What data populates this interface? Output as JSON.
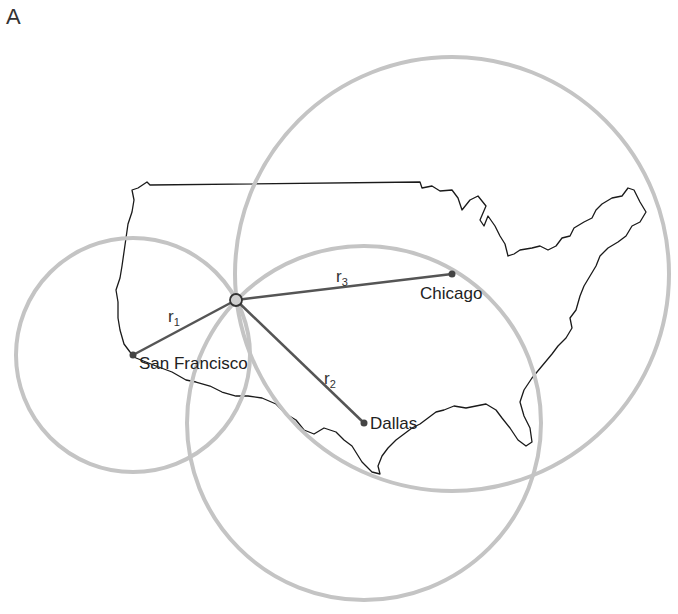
{
  "figure": {
    "panel_label": "A",
    "colors": {
      "circle_stroke": "#c4c4c4",
      "map_outline": "#1a1a1a",
      "line": "#555555",
      "point": "#444444",
      "text": "#222222"
    }
  },
  "receiver": {
    "x": 236,
    "y": 300
  },
  "cities": [
    {
      "name": "San Francisco",
      "x": 133,
      "y": 355,
      "radius": 117,
      "range_label": "r",
      "range_sub": "1"
    },
    {
      "name": "Dallas",
      "x": 364,
      "y": 423,
      "radius": 177,
      "range_label": "r",
      "range_sub": "2"
    },
    {
      "name": "Chicago",
      "x": 452,
      "y": 274,
      "radius": 217,
      "range_label": "r",
      "range_sub": "3"
    }
  ]
}
